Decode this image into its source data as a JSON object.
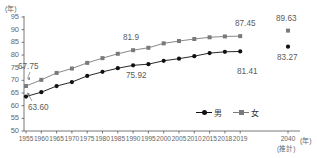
{
  "chart_data": {
    "type": "line",
    "title": "",
    "xlabel": "年",
    "ylabel": "年",
    "ylim": [
      50,
      95
    ],
    "ytick_step": 5,
    "yticks": [
      95,
      90,
      85,
      80,
      75,
      70,
      65,
      60,
      55,
      50
    ],
    "grid": false,
    "legend_position": "bottom-right",
    "categories": [
      "1955",
      "1960",
      "1965",
      "1970",
      "1975",
      "1980",
      "1985",
      "1990",
      "1995",
      "2000",
      "2005",
      "2010",
      "2015",
      "2018",
      "2019",
      "2040"
    ],
    "projection_category": "2040",
    "projection_note": "(推計)",
    "series": [
      {
        "name": "男",
        "marker": "circle",
        "color": "#111111",
        "values": [
          63.6,
          65.32,
          67.74,
          69.31,
          71.73,
          73.35,
          74.78,
          75.92,
          76.38,
          77.72,
          78.56,
          79.55,
          80.75,
          81.25,
          81.41,
          83.27
        ]
      },
      {
        "name": "女",
        "marker": "square",
        "color": "#7a7a7a",
        "values": [
          67.75,
          70.19,
          72.92,
          74.66,
          76.89,
          78.76,
          80.48,
          81.9,
          82.85,
          84.6,
          85.52,
          86.3,
          86.99,
          87.32,
          87.45,
          89.63
        ]
      }
    ],
    "annotations": [
      {
        "text": "67.75",
        "series": "女",
        "category": "1955",
        "x": 18,
        "y": 62,
        "arrow": true
      },
      {
        "text": "63.60",
        "series": "男",
        "category": "1955",
        "x": 28,
        "y": 103,
        "arrow": true
      },
      {
        "text": "81.9",
        "series": "女",
        "category": "1990",
        "x": 123,
        "y": 33,
        "arrow": false
      },
      {
        "text": "75.92",
        "series": "男",
        "category": "1990",
        "x": 126,
        "y": 71,
        "arrow": false
      },
      {
        "text": "87.45",
        "series": "女",
        "category": "2019",
        "x": 235,
        "y": 19,
        "arrow": false
      },
      {
        "text": "81.41",
        "series": "男",
        "category": "2019",
        "x": 237,
        "y": 67,
        "arrow": false
      },
      {
        "text": "89.63",
        "series": "女",
        "category": "2040",
        "x": 276,
        "y": 14,
        "arrow": false
      },
      {
        "text": "83.27",
        "series": "男",
        "category": "2040",
        "x": 277,
        "y": 53,
        "arrow": false
      }
    ]
  },
  "axis": {
    "y_unit": "(年)",
    "x_unit": "(年)",
    "x_projection_label": "2040",
    "x_projection_sub": "(推計)"
  },
  "legend": {
    "male_label": "男",
    "female_label": "女"
  }
}
